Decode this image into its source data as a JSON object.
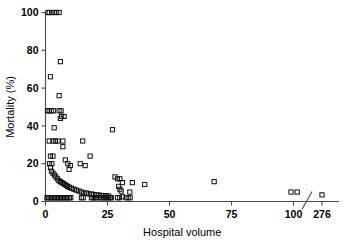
{
  "chart_data": {
    "type": "scatter",
    "title": "",
    "xlabel": "Hospital volume",
    "ylabel": "Mortality (%)",
    "xticks": [
      0,
      25,
      50,
      75,
      100,
      276
    ],
    "yticks": [
      0,
      20,
      40,
      60,
      80,
      100
    ],
    "xlim": [
      0,
      276
    ],
    "ylim": [
      0,
      100
    ],
    "grid": false,
    "legend": null,
    "axis_break": {
      "present": true,
      "between": [
        110,
        276
      ],
      "symbol": "slash"
    },
    "marker": {
      "shape": "open-square",
      "size": 4,
      "edge_color": "#111111",
      "face_color": "none"
    },
    "points": [
      [
        1,
        100
      ],
      [
        1.5,
        100
      ],
      [
        2.5,
        100
      ],
      [
        3.5,
        100
      ],
      [
        4.5,
        100
      ],
      [
        5.5,
        100
      ],
      [
        6,
        74
      ],
      [
        2,
        66
      ],
      [
        5.5,
        56
      ],
      [
        0.8,
        48
      ],
      [
        1.5,
        48
      ],
      [
        2.3,
        48
      ],
      [
        3.2,
        48
      ],
      [
        5.5,
        48
      ],
      [
        6.3,
        48
      ],
      [
        6.5,
        45
      ],
      [
        7.5,
        45
      ],
      [
        6,
        44
      ],
      [
        3.5,
        39
      ],
      [
        27,
        38
      ],
      [
        1.5,
        32
      ],
      [
        3,
        32
      ],
      [
        4,
        32
      ],
      [
        5,
        32
      ],
      [
        7,
        32
      ],
      [
        15,
        32
      ],
      [
        7,
        29
      ],
      [
        18,
        24
      ],
      [
        2,
        24
      ],
      [
        3,
        24
      ],
      [
        8,
        22
      ],
      [
        1.6,
        20
      ],
      [
        2.6,
        20
      ],
      [
        9,
        20
      ],
      [
        14,
        20
      ],
      [
        10,
        19
      ],
      [
        16,
        19
      ],
      [
        2,
        18
      ],
      [
        9.5,
        17
      ],
      [
        2.4,
        16
      ],
      [
        3,
        15
      ],
      [
        3.6,
        14
      ],
      [
        28,
        13
      ],
      [
        4.2,
        13
      ],
      [
        29,
        12
      ],
      [
        30,
        12
      ],
      [
        4.8,
        12
      ],
      [
        5.4,
        11
      ],
      [
        68,
        10.5
      ],
      [
        6,
        10.5
      ],
      [
        31,
        10
      ],
      [
        35,
        10
      ],
      [
        6.6,
        10
      ],
      [
        7.2,
        9.5
      ],
      [
        40,
        9
      ],
      [
        7.8,
        9
      ],
      [
        8.4,
        8.5
      ],
      [
        29.5,
        8
      ],
      [
        9,
        8
      ],
      [
        9.6,
        7.5
      ],
      [
        10.5,
        7
      ],
      [
        30,
        6.5
      ],
      [
        11.5,
        6.5
      ],
      [
        12.5,
        6
      ],
      [
        30.5,
        5.5
      ],
      [
        13.5,
        5.5
      ],
      [
        34,
        5
      ],
      [
        14.5,
        5
      ],
      [
        99,
        5
      ],
      [
        101.5,
        5
      ],
      [
        15.5,
        4.5
      ],
      [
        16.5,
        4.5
      ],
      [
        276,
        3.5
      ],
      [
        17.5,
        4
      ],
      [
        18.5,
        4
      ],
      [
        19.5,
        3.7
      ],
      [
        20.5,
        3.5
      ],
      [
        21.5,
        3.4
      ],
      [
        22.5,
        3.2
      ],
      [
        23.5,
        3.1
      ],
      [
        24.5,
        3.0
      ],
      [
        25.5,
        2.9
      ],
      [
        31,
        2.5
      ],
      [
        26.5,
        2.0
      ],
      [
        0.6,
        2
      ],
      [
        1.2,
        2
      ],
      [
        1.8,
        2
      ],
      [
        2.4,
        2
      ],
      [
        3.0,
        2
      ],
      [
        3.6,
        2
      ],
      [
        4.2,
        2
      ],
      [
        4.8,
        2
      ],
      [
        5.4,
        2
      ],
      [
        6.0,
        2
      ],
      [
        6.6,
        2
      ],
      [
        7.2,
        2
      ],
      [
        7.8,
        2
      ],
      [
        8.4,
        2
      ],
      [
        9.0,
        2
      ],
      [
        9.6,
        2
      ],
      [
        10.2,
        2
      ],
      [
        14.5,
        2
      ],
      [
        15.2,
        2
      ],
      [
        18.5,
        2
      ],
      [
        19.2,
        2
      ],
      [
        19.9,
        2
      ],
      [
        20.6,
        2
      ],
      [
        22.0,
        2
      ],
      [
        22.7,
        2
      ],
      [
        23.4,
        2
      ],
      [
        24.1,
        2
      ],
      [
        24.8,
        2
      ],
      [
        25.5,
        2
      ],
      [
        26.2,
        2
      ],
      [
        29.0,
        2
      ],
      [
        29.8,
        2
      ],
      [
        32.5,
        2
      ],
      [
        33.3,
        2
      ],
      [
        34.1,
        2
      ]
    ]
  },
  "axes": {
    "y_title": "Mortality (%)",
    "x_title": "Hospital volume",
    "x_tick_labels": [
      "0",
      "25",
      "50",
      "75",
      "100",
      "276"
    ],
    "y_tick_labels": [
      "0",
      "20",
      "40",
      "60",
      "80",
      "100"
    ]
  }
}
